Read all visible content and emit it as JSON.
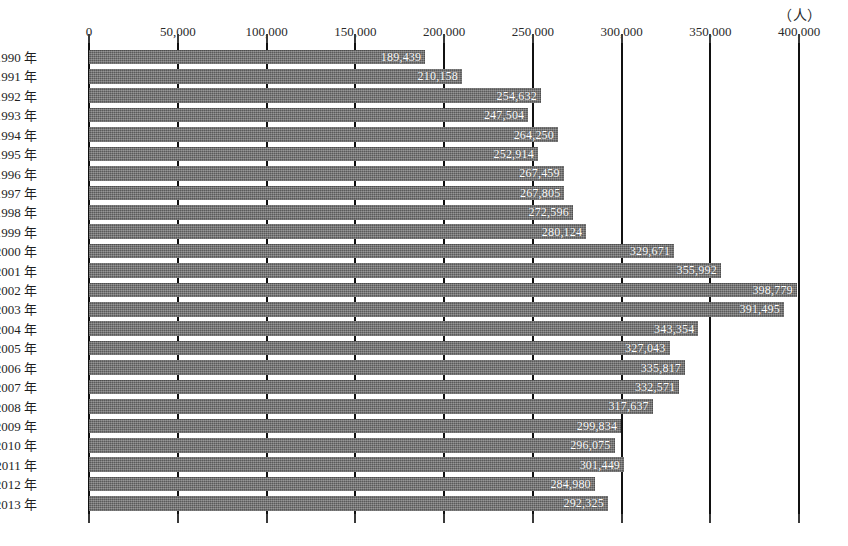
{
  "chart_data": {
    "type": "bar",
    "orientation": "horizontal",
    "title": "",
    "subtitle": "",
    "unit_caption": "（人）",
    "xlabel": "",
    "ylabel": "",
    "xlim": [
      0,
      400000
    ],
    "xticks": [
      0,
      50000,
      100000,
      150000,
      200000,
      250000,
      300000,
      350000,
      400000
    ],
    "xtick_labels": [
      "0",
      "50,000",
      "100,000",
      "150,000",
      "200,000",
      "250,000",
      "300,000",
      "350,000",
      "400,000"
    ],
    "grid": true,
    "grid_axis": "x",
    "legend": false,
    "bar_color": "#6e6e6e",
    "value_label_color": "#ffffff",
    "categories": [
      "1990 年",
      "1991 年",
      "1992 年",
      "1993 年",
      "1994 年",
      "1995 年",
      "1996 年",
      "1997 年",
      "1998 年",
      "1999 年",
      "2000 年",
      "2001 年",
      "2002 年",
      "2003 年",
      "2004 年",
      "2005 年",
      "2006 年",
      "2007 年",
      "2008 年",
      "2009 年",
      "2010 年",
      "2011 年",
      "2012 年",
      "2013 年"
    ],
    "values": [
      189439,
      210158,
      254632,
      247504,
      264250,
      252914,
      267459,
      267805,
      272596,
      280124,
      329671,
      355992,
      398779,
      391495,
      343354,
      327043,
      335817,
      332571,
      317637,
      299834,
      296075,
      301449,
      284980,
      292325
    ],
    "value_labels": [
      "189,439",
      "210,158",
      "254,632",
      "247,504",
      "264,250",
      "252,914",
      "267,459",
      "267,805",
      "272,596",
      "280,124",
      "329,671",
      "355,992",
      "398,779",
      "391,495",
      "343,354",
      "327,043",
      "335,817",
      "332,571",
      "317,637",
      "299,834",
      "296,075",
      "301,449",
      "284,980",
      "292,325"
    ]
  }
}
